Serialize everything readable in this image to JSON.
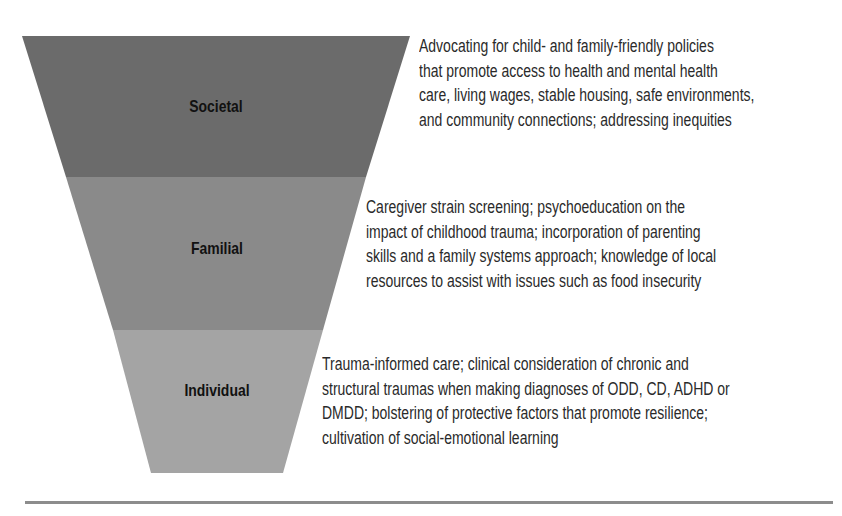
{
  "levels": [
    {
      "name": "Societal",
      "color": "#6b6b6b",
      "description_lines": [
        "Advocating for child- and family-friendly policies",
        "that promote access to health and mental health",
        "care, living wages, stable housing, safe environments,",
        "and community connections; addressing inequities"
      ]
    },
    {
      "name": "Familial",
      "color": "#898989",
      "description_lines": [
        "Caregiver strain screening; psychoeducation on the",
        "impact of childhood trauma; incorporation of parenting",
        "skills and a family systems approach; knowledge of local",
        "resources to assist with issues such as food insecurity"
      ]
    },
    {
      "name": "Individual",
      "color": "#a3a3a3",
      "description_lines": [
        "Trauma-informed care; clinical consideration of chronic and",
        "structural traumas when making diagnoses of ODD, CD, ADHD or",
        "DMDD; bolstering of protective factors that promote resilience;",
        "cultivation of social-emotional learning"
      ]
    }
  ]
}
